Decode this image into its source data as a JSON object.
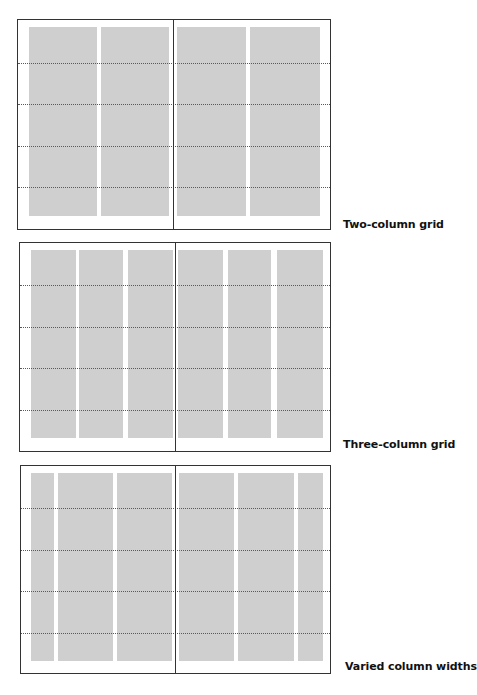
{
  "diagrams": [
    {
      "id": "two-column",
      "label": "Two-column grid",
      "frame": {
        "left": 17,
        "top": 19,
        "width": 314,
        "height": 211
      },
      "spine_x": 155,
      "columns": [
        {
          "x": 11,
          "w": 68
        },
        {
          "x": 83,
          "w": 68
        },
        {
          "x": 159,
          "w": 69
        },
        {
          "x": 232,
          "w": 70
        }
      ],
      "col_top": 7,
      "col_bottom": 196,
      "hlines": [
        43,
        84,
        126,
        167
      ],
      "label_pos": {
        "left": 343,
        "top": 218
      }
    },
    {
      "id": "three-column",
      "label": "Three-column grid",
      "frame": {
        "left": 19,
        "top": 242,
        "width": 312,
        "height": 210
      },
      "spine_x": 155,
      "columns": [
        {
          "x": 11,
          "w": 45
        },
        {
          "x": 59,
          "w": 44
        },
        {
          "x": 108,
          "w": 45
        },
        {
          "x": 158,
          "w": 45
        },
        {
          "x": 208,
          "w": 43
        },
        {
          "x": 257,
          "w": 46
        }
      ],
      "col_top": 7,
      "col_bottom": 195,
      "hlines": [
        42,
        84,
        125,
        167
      ],
      "label_pos": {
        "left": 343,
        "top": 438
      }
    },
    {
      "id": "varied-widths",
      "label": "Varied column widths",
      "frame": {
        "left": 20,
        "top": 465,
        "width": 311,
        "height": 209
      },
      "spine_x": 154,
      "columns": [
        {
          "x": 10,
          "w": 23
        },
        {
          "x": 37,
          "w": 55
        },
        {
          "x": 96,
          "w": 55
        },
        {
          "x": 158,
          "w": 55
        },
        {
          "x": 217,
          "w": 56
        },
        {
          "x": 277,
          "w": 25
        }
      ],
      "col_top": 7,
      "col_bottom": 195,
      "hlines": [
        42,
        84,
        125,
        167
      ],
      "label_pos": {
        "left": 345,
        "top": 660
      }
    }
  ],
  "colors": {
    "frame_border": "#333333",
    "column_fill": "#cfcfcf",
    "guide_line": "#5a5a5a",
    "label_text": "#111111"
  }
}
